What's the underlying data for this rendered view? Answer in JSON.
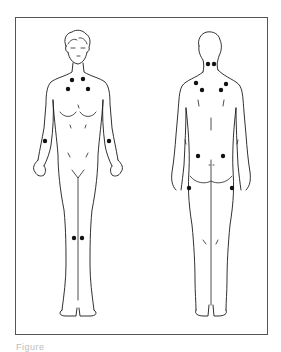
{
  "diagram": {
    "type": "anatomical-figure",
    "views": [
      {
        "name": "anterior",
        "label": "Front view",
        "tender_points": [
          {
            "region": "lower-neck-left",
            "x": 72,
            "y": 80
          },
          {
            "region": "lower-neck-right",
            "x": 83,
            "y": 79
          },
          {
            "region": "second-rib-left",
            "x": 68,
            "y": 89
          },
          {
            "region": "second-rib-right",
            "x": 88,
            "y": 89
          },
          {
            "region": "lateral-epicondyle-left",
            "x": 45,
            "y": 141
          },
          {
            "region": "lateral-epicondyle-right",
            "x": 109,
            "y": 141
          },
          {
            "region": "knee-left",
            "x": 74,
            "y": 238
          },
          {
            "region": "knee-right",
            "x": 82,
            "y": 238
          }
        ]
      },
      {
        "name": "posterior",
        "label": "Back view",
        "tender_points": [
          {
            "region": "occiput-left",
            "x": 208,
            "y": 64
          },
          {
            "region": "occiput-right",
            "x": 214,
            "y": 64
          },
          {
            "region": "trapezius-left",
            "x": 196,
            "y": 83
          },
          {
            "region": "trapezius-right",
            "x": 226,
            "y": 84
          },
          {
            "region": "supraspinatus-left",
            "x": 202,
            "y": 90
          },
          {
            "region": "supraspinatus-right",
            "x": 221,
            "y": 90
          },
          {
            "region": "gluteal-left",
            "x": 198,
            "y": 156
          },
          {
            "region": "gluteal-right",
            "x": 223,
            "y": 156
          },
          {
            "region": "greater-trochanter-left",
            "x": 189,
            "y": 188
          },
          {
            "region": "greater-trochanter-right",
            "x": 232,
            "y": 188
          }
        ]
      }
    ],
    "point_color": "#111111",
    "frame_color": "#555555"
  },
  "caption": {
    "text": "Figure"
  }
}
